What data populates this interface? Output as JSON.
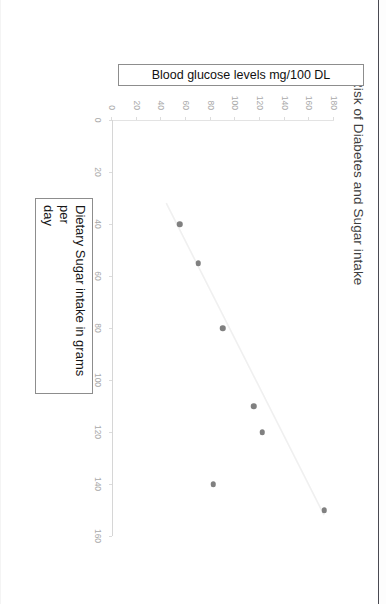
{
  "document": {
    "background_color": "#ffffff",
    "page_border_color": "#4a4a52",
    "rotation_note": "90"
  },
  "chart_data": {
    "type": "scatter",
    "title": "Risk of Diabetes and Sugar intake",
    "xlabel": "Dietary Sugar intake in grams per day",
    "ylabel": "Blood glucose levels mg/100 DL",
    "xlim": [
      0,
      160
    ],
    "ylim": [
      0,
      180
    ],
    "xticks": [
      0,
      20,
      40,
      60,
      80,
      100,
      120,
      140,
      160
    ],
    "yticks": [
      0,
      20,
      40,
      60,
      80,
      100,
      120,
      140,
      160,
      180
    ],
    "xtick_labels": [
      "0",
      "20",
      "40",
      "60",
      "80",
      "100",
      "120",
      "140",
      "160"
    ],
    "ytick_labels": [
      "0",
      "20",
      "40",
      "60",
      "80",
      "100",
      "120",
      "140",
      "160",
      "180"
    ],
    "grid": false,
    "legend": false,
    "marker_color": "#808080",
    "marker_size": 5.5,
    "trendline": {
      "visible": true,
      "color": "#f0f0f0",
      "x_start": 32,
      "y_start": 44,
      "x_end": 152,
      "y_end": 172
    },
    "series": [
      {
        "name": "Blood glucose levels",
        "points": [
          {
            "x": 40,
            "y": 55
          },
          {
            "x": 55,
            "y": 70
          },
          {
            "x": 80,
            "y": 90
          },
          {
            "x": 110,
            "y": 115
          },
          {
            "x": 120,
            "y": 122
          },
          {
            "x": 140,
            "y": 82
          },
          {
            "x": 150,
            "y": 172
          }
        ]
      }
    ]
  },
  "axis_title_x": {
    "line1": "Dietary Sugar intake in grams per",
    "line2": "day"
  },
  "axis_title_y": {
    "text": "Blood glucose levels mg/100 DL"
  }
}
